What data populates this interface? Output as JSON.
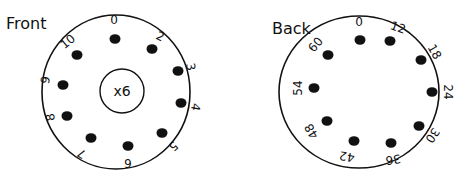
{
  "front": {
    "title": "Front",
    "center_label": "x6",
    "cx": 116,
    "cy": 92,
    "rx": 74,
    "ry": 77,
    "inner": {
      "cx": 122,
      "cy": 91,
      "r": 22
    },
    "positions": [
      {
        "label": "0",
        "dot": [
          115,
          39
        ],
        "text": [
          114,
          20
        ],
        "rot": 0
      },
      {
        "label": "2",
        "dot": [
          152,
          49
        ],
        "text": [
          160,
          37
        ],
        "rot": 25
      },
      {
        "label": "3",
        "dot": [
          178,
          71
        ],
        "text": [
          190,
          67
        ],
        "rot": 80
      },
      {
        "label": "4",
        "dot": [
          181,
          103
        ],
        "text": [
          195,
          107
        ],
        "rot": 100
      },
      {
        "label": "5",
        "dot": [
          162,
          133
        ],
        "text": [
          173,
          146
        ],
        "rot": 140
      },
      {
        "label": "6",
        "dot": [
          128,
          146
        ],
        "text": [
          128,
          162
        ],
        "rot": 180
      },
      {
        "label": "7",
        "dot": [
          91,
          138
        ],
        "text": [
          82,
          153
        ],
        "rot": 210
      },
      {
        "label": "8",
        "dot": [
          67,
          116
        ],
        "text": [
          51,
          117
        ],
        "rot": 260
      },
      {
        "label": "9",
        "dot": [
          63,
          85
        ],
        "text": [
          46,
          80
        ],
        "rot": 280
      },
      {
        "label": "10",
        "dot": [
          77,
          55
        ],
        "text": [
          68,
          42
        ],
        "rot": 320
      }
    ]
  },
  "back": {
    "title": "Back",
    "cx": 359,
    "cy": 92,
    "rx": 80,
    "ry": 76,
    "positions": [
      {
        "label": "0",
        "dot": [
          360,
          40
        ],
        "text": [
          359,
          22
        ],
        "rot": 0
      },
      {
        "label": "12",
        "dot": [
          390,
          41
        ],
        "text": [
          398,
          28
        ],
        "rot": 20
      },
      {
        "label": "18",
        "dot": [
          421,
          60
        ],
        "text": [
          434,
          52
        ],
        "rot": 60
      },
      {
        "label": "24",
        "dot": [
          432,
          92
        ],
        "text": [
          447,
          92
        ],
        "rot": 90
      },
      {
        "label": "30",
        "dot": [
          419,
          126
        ],
        "text": [
          432,
          135
        ],
        "rot": 125
      },
      {
        "label": "36",
        "dot": [
          391,
          143
        ],
        "text": [
          393,
          159
        ],
        "rot": 170
      },
      {
        "label": "42",
        "dot": [
          354,
          141
        ],
        "text": [
          347,
          156
        ],
        "rot": 190
      },
      {
        "label": "48",
        "dot": [
          327,
          121
        ],
        "text": [
          312,
          131
        ],
        "rot": 240
      },
      {
        "label": "54",
        "dot": [
          314,
          88
        ],
        "text": [
          298,
          88
        ],
        "rot": 270
      },
      {
        "label": "60",
        "dot": [
          328,
          55
        ],
        "text": [
          316,
          45
        ],
        "rot": 310
      }
    ]
  }
}
